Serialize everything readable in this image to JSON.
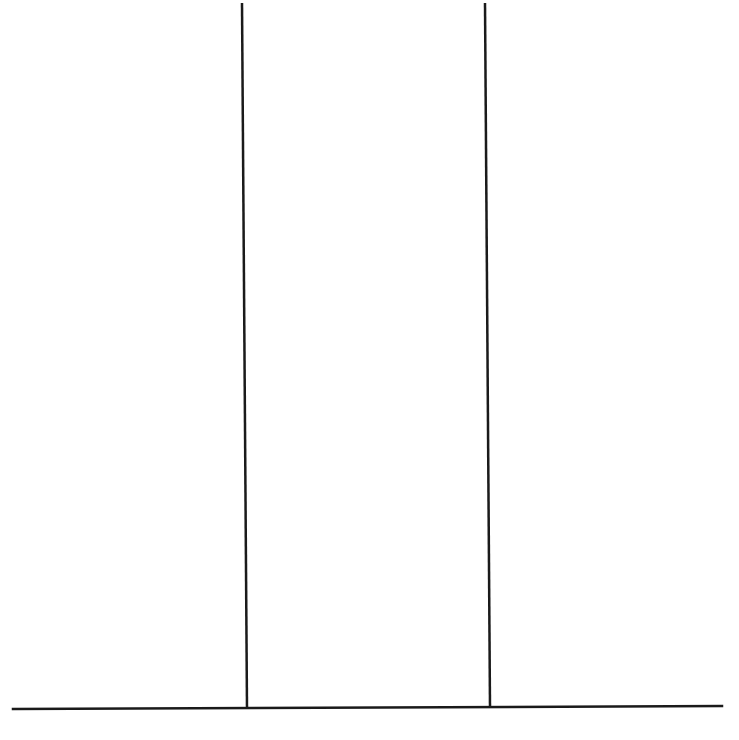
{
  "figure": {
    "background": "#ffffff",
    "line_color": "#1a1a1a",
    "line_width": 2.5,
    "baseline": {
      "x1": 13,
      "y1": 709,
      "x2": 722,
      "y2": 706
    },
    "dividers": [
      {
        "x1": 242,
        "y1": 3,
        "x2": 247,
        "y2": 709
      },
      {
        "x1": 485,
        "y1": 3,
        "x2": 490,
        "y2": 707
      }
    ],
    "columns": 3,
    "cropped_caption": ""
  }
}
